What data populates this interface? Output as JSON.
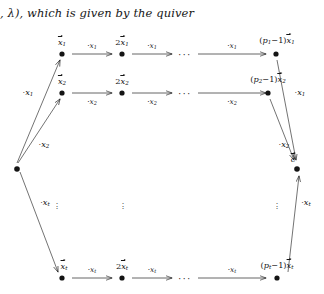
{
  "prose": {
    "line": ", λ), which is given by the quiver"
  },
  "diagram": {
    "left_vertex": {
      "label": ""
    },
    "right_vertex": {
      "label": "c"
    },
    "rows": [
      {
        "id": "row-1",
        "index": "1",
        "node_labels": [
          "x⃗1",
          "2x⃗1",
          "(p1−1)x⃗1"
        ],
        "node_label_parts": [
          {
            "coef": "",
            "vec": "x",
            "sub": "1"
          },
          {
            "coef": "2",
            "vec": "x",
            "sub": "1"
          },
          {
            "coef": "(p₁1−1)",
            "vec": "x",
            "sub": "1"
          }
        ],
        "arrow_labels": [
          "·x1",
          "·x1",
          "·x1"
        ],
        "arrow_label_sub": "1",
        "spine_label": "·x1",
        "ellipsis": "···"
      },
      {
        "id": "row-2",
        "index": "2",
        "node_labels": [
          "x⃗2",
          "2x⃗2",
          "(p2−1)x⃗2"
        ],
        "node_label_parts": [
          {
            "coef": "",
            "vec": "x",
            "sub": "2"
          },
          {
            "coef": "2",
            "vec": "x",
            "sub": "2"
          },
          {
            "coef": "(p₁2−1)",
            "vec": "x",
            "sub": "2"
          }
        ],
        "arrow_labels": [
          "·x2",
          "·x2",
          "·x2"
        ],
        "arrow_label_sub": "2",
        "spine_label": "·x2",
        "ellipsis": "···"
      },
      {
        "id": "row-t",
        "index": "t",
        "node_labels": [
          "x⃗t",
          "2x⃗t",
          "(pt−1)x⃗t"
        ],
        "node_label_parts": [
          {
            "coef": "",
            "vec": "x",
            "sub": "t"
          },
          {
            "coef": "2",
            "vec": "x",
            "sub": "t"
          },
          {
            "coef": "(pₜ−1)",
            "vec": "x",
            "sub": "t"
          }
        ],
        "arrow_labels": [
          "·xt",
          "·xt",
          "·xt"
        ],
        "arrow_label_sub": "t",
        "spine_label": "·xt",
        "ellipsis": "···"
      }
    ],
    "left_edge_labels": [
      "·x1",
      "·x2",
      "·xt"
    ],
    "right_edge_labels": [
      "·x1",
      "·x2",
      "·xt"
    ],
    "vertical_ellipsis": "⋮",
    "symbols": {
      "dot_operator": "·",
      "minus": "−",
      "horizontal_ellipsis": "···"
    },
    "colors": {
      "ink": "#141414",
      "paper": "#ffffff"
    }
  }
}
